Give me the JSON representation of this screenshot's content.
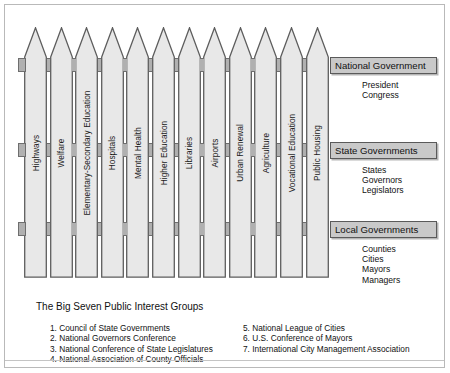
{
  "diagram": {
    "fence": {
      "pickets": [
        {
          "label": "Highways"
        },
        {
          "label": "Welfare"
        },
        {
          "label": "Elementary-Secondary Education"
        },
        {
          "label": "Hospitals"
        },
        {
          "label": "Mental Health"
        },
        {
          "label": "Higher Education"
        },
        {
          "label": "Libraries"
        },
        {
          "label": "Airports"
        },
        {
          "label": "Urban Renewal"
        },
        {
          "label": "Agriculture"
        },
        {
          "label": "Vocational Education"
        },
        {
          "label": "Public Housing"
        }
      ],
      "rails": [
        {
          "name": "national-rail"
        },
        {
          "name": "state-rail"
        },
        {
          "name": "local-rail"
        }
      ]
    },
    "levels": [
      {
        "bar_label": "National Government",
        "items": [
          "President",
          "Congress"
        ]
      },
      {
        "bar_label": "State Governments",
        "items": [
          "States",
          "Governors",
          "Legislators"
        ]
      },
      {
        "bar_label": "Local Governments",
        "items": [
          "Counties",
          "Cities",
          "Mayors",
          "Managers"
        ]
      }
    ],
    "big_seven": {
      "title": "The Big Seven Public Interest Groups",
      "left_column": [
        "1. Council of State Governments",
        "2. National Governors Conference",
        "3. National Conference of State Legislatures",
        "4. National Association of County Officials"
      ],
      "right_column": [
        "5. National League of Cities",
        "6. U.S. Conference of Mayors",
        "7. International City Management Association"
      ]
    },
    "colors": {
      "picket_fill": "#e8e8e8",
      "picket_stroke": "#5d5d5d",
      "rail_fill": "#b0b0b0",
      "rail_stroke": "#6e6e6e",
      "bar_fill": "#c9c9c9",
      "bar_stroke": "#5a5a5a",
      "text": "#111111",
      "page_bg": "#ffffff"
    }
  }
}
